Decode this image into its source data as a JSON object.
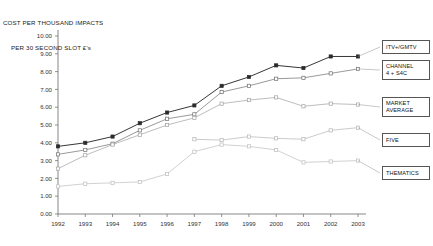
{
  "title": {
    "line1": "COST PER THOUSAND IMPACTS",
    "line2": "PER 30 SECOND SLOT £'s"
  },
  "legend": {
    "items": [
      {
        "name": "itv-gmtv",
        "label": "ITV+/GMTV",
        "color": "#2b2b2b",
        "box": {
          "x": 382,
          "y": 40,
          "w": 48,
          "h": 14
        }
      },
      {
        "name": "channel4-s4c",
        "label": "CHANNEL\n4 + S4C",
        "color": "#6d6d6d",
        "box": {
          "x": 382,
          "y": 60,
          "w": 48,
          "h": 20
        }
      },
      {
        "name": "market-average",
        "label": "MARKET\nAVERAGE",
        "color": "#a0a0a0",
        "box": {
          "x": 382,
          "y": 97,
          "w": 48,
          "h": 20
        }
      },
      {
        "name": "five",
        "label": "FIVE",
        "color": "#b4b4b4",
        "box": {
          "x": 382,
          "y": 133,
          "w": 48,
          "h": 14
        }
      },
      {
        "name": "thematics",
        "label": "THEMATICS",
        "color": "#bdbdbd",
        "box": {
          "x": 382,
          "y": 166,
          "w": 48,
          "h": 14
        }
      }
    ]
  },
  "chart_data": {
    "type": "line",
    "title": "COST PER THOUSAND IMPACTS PER 30 SECOND SLOT £'s",
    "xlabel": "",
    "ylabel": "",
    "grid": false,
    "legend_position": "right",
    "x": [
      1992,
      1993,
      1994,
      1995,
      1996,
      1997,
      1998,
      1999,
      2000,
      2001,
      2002,
      2003
    ],
    "xlim": [
      1992,
      2003
    ],
    "ylim": [
      0.0,
      10.0
    ],
    "yticks": [
      0.0,
      1.0,
      2.0,
      3.0,
      4.0,
      5.0,
      6.0,
      7.0,
      8.0,
      9.0,
      10.0
    ],
    "ytick_labels": [
      "0.00",
      "1.00",
      "2.00",
      "3.00",
      "4.00",
      "5.00",
      "6.00",
      "7.00",
      "8.00",
      "9.00",
      "10.00"
    ],
    "xtick_labels": [
      "1992",
      "1993",
      "1994",
      "1995",
      "1996",
      "1997",
      "1998",
      "1999",
      "2000",
      "2001",
      "2002",
      "2003"
    ],
    "series": [
      {
        "name": "ITV+/GMTV",
        "color": "#2b2b2b",
        "marker": "square",
        "values": [
          3.8,
          4.0,
          4.35,
          5.1,
          5.7,
          6.1,
          7.2,
          7.7,
          8.35,
          8.2,
          8.85,
          8.85
        ]
      },
      {
        "name": "CHANNEL 4 + S4C",
        "color": "#6d6d6d",
        "marker": "square",
        "values": [
          3.35,
          3.6,
          3.95,
          4.7,
          5.35,
          5.6,
          6.85,
          7.2,
          7.6,
          7.65,
          7.9,
          8.15
        ]
      },
      {
        "name": "MARKET AVERAGE",
        "color": "#a0a0a0",
        "marker": "square",
        "values": [
          2.55,
          3.3,
          3.9,
          4.45,
          5.0,
          5.4,
          6.2,
          6.4,
          6.55,
          6.05,
          6.2,
          6.15
        ]
      },
      {
        "name": "FIVE",
        "color": "#b4b4b4",
        "marker": "square",
        "values": [
          null,
          null,
          null,
          null,
          null,
          4.2,
          4.15,
          4.35,
          4.25,
          4.2,
          4.7,
          4.85
        ]
      },
      {
        "name": "THEMATICS",
        "color": "#bdbdbd",
        "marker": "square",
        "values": [
          1.55,
          1.7,
          1.75,
          1.8,
          2.25,
          3.5,
          3.9,
          3.8,
          3.6,
          2.9,
          2.95,
          3.0
        ]
      }
    ]
  },
  "plot_geometry": {
    "left": 58,
    "right": 358,
    "top": 36,
    "bottom": 214
  }
}
